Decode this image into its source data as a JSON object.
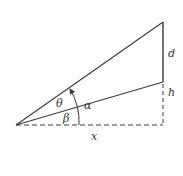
{
  "diagram": {
    "type": "geometry-angle-diagram",
    "labels": {
      "theta": "θ",
      "alpha": "α",
      "beta": "β",
      "d": "d",
      "h": "h",
      "x": "x"
    },
    "colors": {
      "line": "#3a3a3a",
      "background": "#ffffff"
    },
    "points": {
      "origin": [
        16,
        125
      ],
      "top_right": [
        163,
        22
      ],
      "mid_right": [
        163,
        82
      ],
      "bottom_right": [
        163,
        125
      ]
    }
  }
}
